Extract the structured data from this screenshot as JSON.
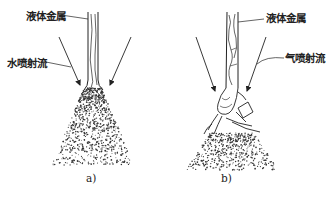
{
  "panels": [
    {
      "id": "a",
      "caption": "a)",
      "labels": {
        "liquid_metal": "液体金属",
        "jet": "水喷射流"
      }
    },
    {
      "id": "b",
      "caption": "b)",
      "labels": {
        "liquid_metal": "液体金属",
        "jet": "气喷射流"
      }
    }
  ],
  "colors": {
    "line": "#222222",
    "background": "#ffffff"
  }
}
